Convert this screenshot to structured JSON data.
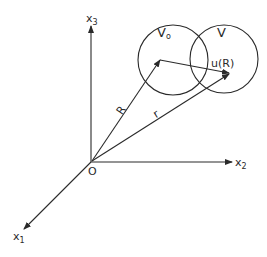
{
  "diagram": {
    "axes": {
      "x1": {
        "label": "x",
        "sub": "1"
      },
      "x2": {
        "label": "x",
        "sub": "2"
      },
      "x3": {
        "label": "x",
        "sub": "3"
      },
      "origin": "O"
    },
    "vectors": {
      "R": "R",
      "r": "r",
      "u": "u(R)"
    },
    "regions": {
      "V0": {
        "label": "V",
        "sub": "o"
      },
      "V": {
        "label": "V"
      }
    },
    "colors": {
      "ink": "#2a2a2a",
      "background": "#ffffff"
    }
  }
}
